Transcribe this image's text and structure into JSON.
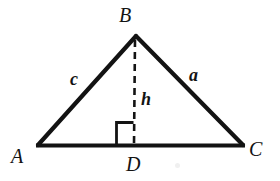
{
  "figure": {
    "type": "geometry-diagram",
    "background_color": "#ffffff",
    "stroke_color": "#131313",
    "canvas": {
      "width": 280,
      "height": 181
    },
    "vertices": [
      {
        "id": "A",
        "label": "A",
        "x": 38,
        "y": 145
      },
      {
        "id": "B",
        "label": "B",
        "x": 136,
        "y": 36
      },
      {
        "id": "C",
        "label": "C",
        "x": 243,
        "y": 145
      },
      {
        "id": "D",
        "label": "D",
        "x": 134,
        "y": 145
      }
    ],
    "sides": [
      {
        "id": "c",
        "label": "c",
        "from": "A",
        "to": "B",
        "style": "solid"
      },
      {
        "id": "a",
        "label": "a",
        "from": "B",
        "to": "C",
        "style": "solid"
      },
      {
        "id": "b",
        "label": "",
        "from": "A",
        "to": "C",
        "style": "solid"
      }
    ],
    "altitude": {
      "id": "h",
      "label": "h",
      "from": "B",
      "to": "D",
      "style": "dashed",
      "dash_pattern": "7 5"
    },
    "right_angle_marker": {
      "at": "D",
      "label": "",
      "x": 117,
      "y": 122,
      "size": 17
    },
    "labels": {
      "B": "B",
      "A": "A",
      "C": "C",
      "D": "D",
      "side_c": "c",
      "side_a": "a",
      "altitude_h": "h"
    }
  }
}
